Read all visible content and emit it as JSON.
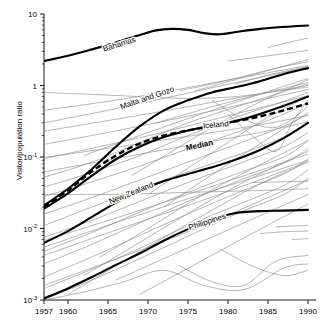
{
  "chart_data": {
    "type": "line",
    "title": "",
    "xlabel": "",
    "ylabel": "Visitor/population ratio",
    "xlim": [
      1957,
      1991
    ],
    "ylim": [
      0.001,
      10
    ],
    "yscale": "log",
    "xscale": "linear",
    "grid": false,
    "legend": "inline-labels",
    "xticks": [
      1957,
      1960,
      1965,
      1970,
      1975,
      1980,
      1985,
      1990
    ],
    "xtick_labels": [
      "1957",
      "1960",
      "1965",
      "1970",
      "1975",
      "1980",
      "1985",
      "1990"
    ],
    "yticks": [
      10,
      1,
      0.1,
      0.01,
      0.001
    ],
    "ytick_labels": [
      "10",
      "1",
      "10",
      "10",
      "10"
    ],
    "ytick_exponents": [
      "",
      "",
      "-1",
      "-2",
      "-3"
    ],
    "annotations": [
      {
        "text": "Bahamas",
        "x": 1966.5,
        "y": 3.5,
        "rotate": -17
      },
      {
        "text": "Malta and Gozo",
        "x": 1970.0,
        "y": 0.62,
        "rotate": -19
      },
      {
        "text": "Iceland",
        "x": 1978.5,
        "y": 0.26,
        "rotate": -5
      },
      {
        "text": "Median",
        "x": 1976.5,
        "y": 0.135,
        "rotate": -12
      },
      {
        "text": "New Zealand",
        "x": 1968.0,
        "y": 0.029,
        "rotate": -22
      },
      {
        "text": "Philippines",
        "x": 1977.5,
        "y": 0.0115,
        "rotate": -18
      }
    ],
    "series": [
      {
        "name": "Bahamas",
        "highlight": true,
        "x": [
          1957,
          1960,
          1963,
          1966,
          1969,
          1971,
          1973,
          1975,
          1977,
          1979,
          1981,
          1984,
          1987,
          1990
        ],
        "values": [
          2.2,
          2.6,
          3.2,
          4.0,
          5.1,
          5.9,
          6.2,
          6.0,
          5.4,
          5.2,
          5.6,
          6.2,
          6.6,
          6.9
        ]
      },
      {
        "name": "Malta and Gozo",
        "highlight": true,
        "x": [
          1957,
          1960,
          1963,
          1966,
          1969,
          1972,
          1975,
          1978,
          1981,
          1984,
          1987,
          1990
        ],
        "values": [
          0.021,
          0.036,
          0.068,
          0.14,
          0.27,
          0.45,
          0.62,
          0.8,
          0.95,
          1.15,
          1.45,
          1.75
        ]
      },
      {
        "name": "Iceland",
        "highlight": true,
        "x": [
          1957,
          1960,
          1963,
          1966,
          1969,
          1972,
          1975,
          1978,
          1981,
          1984,
          1987,
          1990
        ],
        "values": [
          0.019,
          0.031,
          0.055,
          0.093,
          0.14,
          0.19,
          0.235,
          0.275,
          0.32,
          0.4,
          0.52,
          0.7
        ]
      },
      {
        "name": "Median",
        "highlight": true,
        "dashed": true,
        "x": [
          1957,
          1960,
          1963,
          1966,
          1969,
          1972,
          1975,
          1978,
          1981,
          1984,
          1987,
          1990
        ],
        "values": [
          0.02,
          0.034,
          0.063,
          0.105,
          0.155,
          0.2,
          0.235,
          0.27,
          0.315,
          0.37,
          0.45,
          0.56
        ]
      },
      {
        "name": "New Zealand",
        "highlight": true,
        "x": [
          1957,
          1960,
          1963,
          1966,
          1969,
          1972,
          1975,
          1978,
          1981,
          1984,
          1987,
          1990
        ],
        "values": [
          0.0063,
          0.0092,
          0.0145,
          0.023,
          0.034,
          0.046,
          0.058,
          0.072,
          0.092,
          0.125,
          0.185,
          0.3
        ]
      },
      {
        "name": "Philippines",
        "highlight": true,
        "x": [
          1957,
          1960,
          1963,
          1966,
          1969,
          1972,
          1975,
          1978,
          1981,
          1984,
          1987,
          1990
        ],
        "values": [
          0.00105,
          0.00145,
          0.0021,
          0.0031,
          0.0045,
          0.0068,
          0.0098,
          0.0135,
          0.0165,
          0.0175,
          0.0178,
          0.0182
        ]
      },
      {
        "name": "other-01",
        "highlight": false,
        "x": [
          1957,
          1963,
          1969,
          1975,
          1981,
          1987,
          1990
        ],
        "values": [
          0.8,
          0.75,
          0.7,
          0.66,
          0.7,
          0.86,
          0.95
        ]
      },
      {
        "name": "other-02",
        "highlight": false,
        "x": [
          1957,
          1963,
          1969,
          1975,
          1981,
          1987,
          1990
        ],
        "values": [
          0.052,
          0.085,
          0.16,
          0.3,
          0.5,
          0.82,
          1.05
        ]
      },
      {
        "name": "other-03",
        "highlight": false,
        "x": [
          1957,
          1963,
          1969,
          1975,
          1981,
          1987,
          1990
        ],
        "values": [
          0.038,
          0.061,
          0.105,
          0.2,
          0.36,
          0.6,
          0.8
        ]
      },
      {
        "name": "other-04",
        "highlight": false,
        "x": [
          1957,
          1963,
          1969,
          1975,
          1981,
          1987,
          1990
        ],
        "values": [
          0.028,
          0.045,
          0.075,
          0.13,
          0.22,
          0.4,
          0.58
        ]
      },
      {
        "name": "other-05",
        "highlight": false,
        "x": [
          1957,
          1963,
          1969,
          1975,
          1981,
          1987,
          1990
        ],
        "values": [
          0.016,
          0.027,
          0.048,
          0.085,
          0.15,
          0.27,
          0.4
        ]
      },
      {
        "name": "other-06",
        "highlight": false,
        "x": [
          1957,
          1963,
          1969,
          1975,
          1981,
          1987,
          1990
        ],
        "values": [
          0.011,
          0.02,
          0.036,
          0.062,
          0.105,
          0.19,
          0.3
        ]
      },
      {
        "name": "other-07",
        "highlight": false,
        "x": [
          1957,
          1963,
          1969,
          1975,
          1981,
          1987,
          1990
        ],
        "values": [
          0.0075,
          0.013,
          0.024,
          0.044,
          0.078,
          0.14,
          0.22
        ]
      },
      {
        "name": "other-08",
        "highlight": false,
        "x": [
          1957,
          1963,
          1969,
          1975,
          1981,
          1987,
          1990
        ],
        "values": [
          0.0048,
          0.0088,
          0.017,
          0.032,
          0.058,
          0.1,
          0.17
        ]
      },
      {
        "name": "other-09",
        "highlight": false,
        "x": [
          1957,
          1963,
          1969,
          1975,
          1981,
          1987,
          1990
        ],
        "values": [
          0.0032,
          0.006,
          0.012,
          0.024,
          0.045,
          0.082,
          0.13
        ]
      },
      {
        "name": "other-10",
        "highlight": false,
        "x": [
          1957,
          1963,
          1969,
          1975,
          1981,
          1987,
          1990
        ],
        "values": [
          0.0021,
          0.004,
          0.008,
          0.016,
          0.031,
          0.058,
          0.094
        ]
      },
      {
        "name": "other-11",
        "highlight": false,
        "x": [
          1957,
          1963,
          1969,
          1975,
          1981,
          1987,
          1990
        ],
        "values": [
          0.00145,
          0.0027,
          0.0053,
          0.011,
          0.021,
          0.04,
          0.066
        ]
      },
      {
        "name": "other-12",
        "highlight": false,
        "x": [
          1957,
          1963,
          1969,
          1975,
          1981,
          1987,
          1990
        ],
        "values": [
          0.00102,
          0.0019,
          0.0038,
          0.0078,
          0.016,
          0.03,
          0.05
        ]
      },
      {
        "name": "other-13",
        "highlight": false,
        "x": [
          1960,
          1966,
          1972,
          1978,
          1984,
          1990
        ],
        "values": [
          0.0012,
          0.003,
          0.0075,
          0.018,
          0.042,
          0.085
        ]
      },
      {
        "name": "other-14",
        "highlight": false,
        "x": [
          1962,
          1968,
          1974,
          1980,
          1986,
          1990
        ],
        "values": [
          0.0022,
          0.0055,
          0.014,
          0.034,
          0.075,
          0.12
        ]
      },
      {
        "name": "other-15",
        "highlight": false,
        "x": [
          1964,
          1970,
          1976,
          1982,
          1988,
          1990
        ],
        "values": [
          0.004,
          0.01,
          0.026,
          0.06,
          0.13,
          0.17
        ]
      },
      {
        "name": "other-16",
        "highlight": false,
        "x": [
          1957,
          1964,
          1971,
          1978,
          1985,
          1990
        ],
        "values": [
          0.23,
          0.31,
          0.42,
          0.58,
          0.8,
          1.0
        ]
      },
      {
        "name": "other-17",
        "highlight": false,
        "x": [
          1957,
          1964,
          1971,
          1978,
          1985,
          1990
        ],
        "values": [
          0.15,
          0.21,
          0.3,
          0.44,
          0.66,
          0.88
        ]
      },
      {
        "name": "other-18",
        "highlight": false,
        "x": [
          1957,
          1964,
          1971,
          1978,
          1985,
          1990
        ],
        "values": [
          0.095,
          0.14,
          0.21,
          0.33,
          0.52,
          0.72
        ]
      },
      {
        "name": "other-19",
        "highlight": false,
        "x": [
          1968,
          1973,
          1978,
          1983,
          1988,
          1990
        ],
        "values": [
          0.055,
          0.12,
          0.26,
          0.52,
          0.95,
          1.2
        ]
      },
      {
        "name": "other-20",
        "highlight": false,
        "x": [
          1970,
          1975,
          1980,
          1985,
          1990
        ],
        "values": [
          0.03,
          0.07,
          0.16,
          0.36,
          0.7
        ]
      },
      {
        "name": "other-21",
        "highlight": false,
        "x": [
          1972,
          1977,
          1982,
          1987,
          1990
        ],
        "values": [
          0.02,
          0.048,
          0.11,
          0.25,
          0.42
        ]
      },
      {
        "name": "other-22",
        "highlight": false,
        "x": [
          1974,
          1978,
          1982,
          1986,
          1990
        ],
        "values": [
          0.85,
          1.05,
          1.35,
          1.75,
          2.15
        ]
      },
      {
        "name": "other-23",
        "highlight": false,
        "x": [
          1957,
          1965,
          1973,
          1981,
          1990
        ],
        "values": [
          0.3,
          0.45,
          0.7,
          1.1,
          1.8
        ]
      },
      {
        "name": "other-24",
        "highlight": false,
        "x": [
          1957,
          1965,
          1973,
          1981,
          1990
        ],
        "values": [
          0.45,
          0.6,
          0.85,
          1.25,
          1.9
        ]
      },
      {
        "name": "other-25",
        "highlight": false,
        "x": [
          1962,
          1970,
          1978,
          1986,
          1990
        ],
        "values": [
          0.105,
          0.22,
          0.45,
          0.9,
          1.25
        ]
      },
      {
        "name": "other-26",
        "highlight": false,
        "x": [
          1957,
          1962,
          1967,
          1972,
          1977,
          1982,
          1987,
          1990
        ],
        "values": [
          0.001,
          0.0013,
          0.0018,
          0.0026,
          0.0016,
          0.0014,
          0.0028,
          0.0032
        ]
      },
      {
        "name": "other-27",
        "highlight": false,
        "x": [
          1974,
          1978,
          1982,
          1986,
          1990
        ],
        "values": [
          0.003,
          0.0018,
          0.0016,
          0.0035,
          0.0042
        ]
      },
      {
        "name": "other-28",
        "highlight": false,
        "x": [
          1980,
          1983,
          1986,
          1988,
          1990
        ],
        "values": [
          0.4,
          0.2,
          0.12,
          0.3,
          0.62
        ]
      },
      {
        "name": "other-29",
        "highlight": false,
        "x": [
          1978,
          1982,
          1986,
          1990
        ],
        "values": [
          0.62,
          0.34,
          0.26,
          0.5
        ]
      },
      {
        "name": "other-30",
        "highlight": false,
        "x": [
          1957,
          1966,
          1975,
          1984,
          1990
        ],
        "values": [
          0.0068,
          0.014,
          0.03,
          0.065,
          0.11
        ]
      },
      {
        "name": "other-31",
        "highlight": false,
        "x": [
          1957,
          1966,
          1975,
          1984,
          1990
        ],
        "values": [
          0.0042,
          0.0095,
          0.021,
          0.048,
          0.086
        ]
      },
      {
        "name": "other-32",
        "highlight": false,
        "x": [
          1957,
          1966,
          1975,
          1984,
          1990
        ],
        "values": [
          0.03,
          0.03,
          0.032,
          0.034,
          0.036
        ]
      },
      {
        "name": "other-33",
        "highlight": false,
        "x": [
          1984,
          1987,
          1990
        ],
        "values": [
          0.0085,
          0.009,
          0.0092
        ]
      },
      {
        "name": "other-34",
        "highlight": false,
        "x": [
          1966,
          1974,
          1982,
          1990
        ],
        "values": [
          0.0019,
          0.0048,
          0.012,
          0.03
        ]
      },
      {
        "name": "other-35",
        "highlight": false,
        "x": [
          1969,
          1976,
          1983,
          1990
        ],
        "values": [
          0.0012,
          0.0032,
          0.0085,
          0.022
        ]
      },
      {
        "name": "other-36",
        "highlight": false,
        "x": [
          1979,
          1983,
          1987,
          1990
        ],
        "values": [
          0.0052,
          0.003,
          0.0022,
          0.0026
        ]
      },
      {
        "name": "other-37",
        "highlight": false,
        "x": [
          1957,
          1970,
          1983,
          1990
        ],
        "values": [
          0.098,
          0.16,
          0.27,
          0.38
        ]
      },
      {
        "name": "other-38",
        "highlight": false,
        "x": [
          1957,
          1970,
          1983,
          1990
        ],
        "values": [
          0.062,
          0.115,
          0.21,
          0.31
        ]
      },
      {
        "name": "other-39",
        "highlight": false,
        "x": [
          1981,
          1985,
          1990
        ],
        "values": [
          1.05,
          1.4,
          1.85
        ]
      },
      {
        "name": "other-40",
        "highlight": false,
        "x": [
          1983,
          1987,
          1990
        ],
        "values": [
          0.044,
          0.045,
          0.046
        ]
      },
      {
        "name": "other-41",
        "highlight": false,
        "x": [
          1976,
          1982,
          1988,
          1990
        ],
        "values": [
          0.85,
          1.3,
          2.0,
          2.3
        ]
      },
      {
        "name": "other-42",
        "highlight": false,
        "x": [
          1957,
          1973,
          1990
        ],
        "values": [
          0.0055,
          0.022,
          0.09
        ]
      },
      {
        "name": "other-43",
        "highlight": false,
        "x": [
          1986,
          1988,
          1990
        ],
        "values": [
          0.0105,
          0.0108,
          0.011
        ]
      },
      {
        "name": "other-44",
        "highlight": false,
        "x": [
          1971,
          1980,
          1990
        ],
        "values": [
          0.3,
          0.58,
          1.1
        ]
      },
      {
        "name": "other-45",
        "highlight": false,
        "x": [
          1980,
          1985,
          1990
        ],
        "values": [
          2.2,
          2.6,
          3.1
        ]
      },
      {
        "name": "other-46",
        "highlight": false,
        "x": [
          1985,
          1988,
          1990
        ],
        "values": [
          3.4,
          4.1,
          4.6
        ]
      },
      {
        "name": "other-47",
        "highlight": false,
        "x": [
          1957,
          1975,
          1990
        ],
        "values": [
          0.0016,
          0.009,
          0.048
        ]
      },
      {
        "name": "other-48",
        "highlight": false,
        "x": [
          1988,
          1989,
          1990
        ],
        "values": [
          0.007,
          0.0071,
          0.0072
        ]
      }
    ]
  }
}
